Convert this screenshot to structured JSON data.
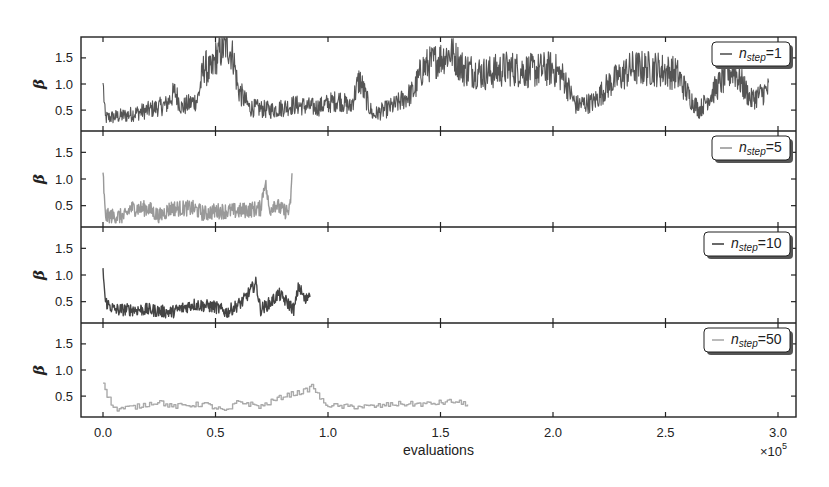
{
  "chart_data": {
    "type": "line",
    "layout": "4 vertically stacked panels sharing x-axis",
    "xlabel": "evaluations",
    "x_multiplier": "×10^5",
    "x_multiplier_base": "×10",
    "x_multiplier_exp": "5",
    "xlim": [
      -0.1,
      3.05
    ],
    "x_ticks": [
      0.0,
      0.5,
      1.0,
      1.5,
      2.0,
      2.5,
      3.0
    ],
    "x_tick_labels": [
      "0.0",
      "0.5",
      "1.0",
      "1.5",
      "2.0",
      "2.5",
      "3.0"
    ],
    "ylabel": "β",
    "ylim": [
      0.1,
      1.9
    ],
    "y_ticks": [
      0.5,
      1.0,
      1.5
    ],
    "y_tick_labels": [
      "0.5",
      "1.0",
      "1.5"
    ],
    "grid": false,
    "legend_position": "upper right of each panel",
    "panels": [
      {
        "legend": "n_step=1",
        "legend_main": "n",
        "legend_sub": "step",
        "legend_value": "=1",
        "color": "#555555",
        "x_end": 2.96,
        "style": "dense noisy",
        "keypoints": [
          [
            0.0,
            1.02
          ],
          [
            0.01,
            0.35
          ],
          [
            0.1,
            0.4
          ],
          [
            0.2,
            0.5
          ],
          [
            0.28,
            0.6
          ],
          [
            0.32,
            0.85
          ],
          [
            0.35,
            0.55
          ],
          [
            0.42,
            0.7
          ],
          [
            0.45,
            1.35
          ],
          [
            0.48,
            1.2
          ],
          [
            0.5,
            1.5
          ],
          [
            0.55,
            1.75
          ],
          [
            0.58,
            1.5
          ],
          [
            0.6,
            0.9
          ],
          [
            0.65,
            0.55
          ],
          [
            0.75,
            0.5
          ],
          [
            0.85,
            0.6
          ],
          [
            0.95,
            0.55
          ],
          [
            1.05,
            0.7
          ],
          [
            1.1,
            0.55
          ],
          [
            1.14,
            1.1
          ],
          [
            1.18,
            0.6
          ],
          [
            1.2,
            0.4
          ],
          [
            1.3,
            0.6
          ],
          [
            1.38,
            0.85
          ],
          [
            1.42,
            1.3
          ],
          [
            1.5,
            1.5
          ],
          [
            1.55,
            1.6
          ],
          [
            1.6,
            1.3
          ],
          [
            1.7,
            1.2
          ],
          [
            1.8,
            1.3
          ],
          [
            1.9,
            1.25
          ],
          [
            2.0,
            1.3
          ],
          [
            2.05,
            1.1
          ],
          [
            2.1,
            0.6
          ],
          [
            2.18,
            0.65
          ],
          [
            2.25,
            1.0
          ],
          [
            2.35,
            1.3
          ],
          [
            2.45,
            1.3
          ],
          [
            2.55,
            1.2
          ],
          [
            2.6,
            0.8
          ],
          [
            2.65,
            0.5
          ],
          [
            2.72,
            0.9
          ],
          [
            2.8,
            1.3
          ],
          [
            2.88,
            0.7
          ],
          [
            2.96,
            0.9
          ]
        ],
        "noise_amplitude": 0.35
      },
      {
        "legend": "n_step=5",
        "legend_main": "n",
        "legend_sub": "step",
        "legend_value": "=5",
        "color": "#999999",
        "x_end": 0.84,
        "style": "noisy",
        "keypoints": [
          [
            0.0,
            1.12
          ],
          [
            0.01,
            0.3
          ],
          [
            0.05,
            0.3
          ],
          [
            0.1,
            0.3
          ],
          [
            0.12,
            0.45
          ],
          [
            0.2,
            0.45
          ],
          [
            0.25,
            0.3
          ],
          [
            0.3,
            0.45
          ],
          [
            0.4,
            0.45
          ],
          [
            0.45,
            0.35
          ],
          [
            0.5,
            0.4
          ],
          [
            0.6,
            0.4
          ],
          [
            0.7,
            0.45
          ],
          [
            0.72,
            0.97
          ],
          [
            0.74,
            0.4
          ],
          [
            0.76,
            0.55
          ],
          [
            0.8,
            0.4
          ],
          [
            0.83,
            0.4
          ],
          [
            0.84,
            1.0
          ]
        ],
        "noise_amplitude": 0.15
      },
      {
        "legend": "n_step=10",
        "legend_main": "n",
        "legend_sub": "step",
        "legend_value": "=10",
        "color": "#444444",
        "x_end": 0.92,
        "style": "noisy",
        "keypoints": [
          [
            0.0,
            1.13
          ],
          [
            0.01,
            0.5
          ],
          [
            0.05,
            0.35
          ],
          [
            0.2,
            0.35
          ],
          [
            0.3,
            0.3
          ],
          [
            0.4,
            0.45
          ],
          [
            0.5,
            0.4
          ],
          [
            0.55,
            0.3
          ],
          [
            0.62,
            0.5
          ],
          [
            0.68,
            0.85
          ],
          [
            0.7,
            0.35
          ],
          [
            0.75,
            0.5
          ],
          [
            0.78,
            0.65
          ],
          [
            0.85,
            0.35
          ],
          [
            0.87,
            0.8
          ],
          [
            0.9,
            0.5
          ],
          [
            0.92,
            0.7
          ]
        ],
        "noise_amplitude": 0.12
      },
      {
        "legend": "n_step=50",
        "legend_main": "n",
        "legend_sub": "step",
        "legend_value": "=50",
        "color": "#aaaaaa",
        "x_end": 1.62,
        "style": "step",
        "keypoints": [
          [
            0.0,
            0.75
          ],
          [
            0.02,
            0.5
          ],
          [
            0.05,
            0.25
          ],
          [
            0.15,
            0.3
          ],
          [
            0.25,
            0.4
          ],
          [
            0.3,
            0.3
          ],
          [
            0.45,
            0.35
          ],
          [
            0.55,
            0.2
          ],
          [
            0.6,
            0.4
          ],
          [
            0.7,
            0.3
          ],
          [
            0.8,
            0.5
          ],
          [
            0.9,
            0.6
          ],
          [
            0.93,
            0.7
          ],
          [
            0.98,
            0.35
          ],
          [
            1.05,
            0.3
          ],
          [
            1.2,
            0.3
          ],
          [
            1.3,
            0.35
          ],
          [
            1.45,
            0.35
          ],
          [
            1.55,
            0.4
          ],
          [
            1.62,
            0.35
          ]
        ],
        "noise_amplitude": 0.05
      }
    ]
  }
}
